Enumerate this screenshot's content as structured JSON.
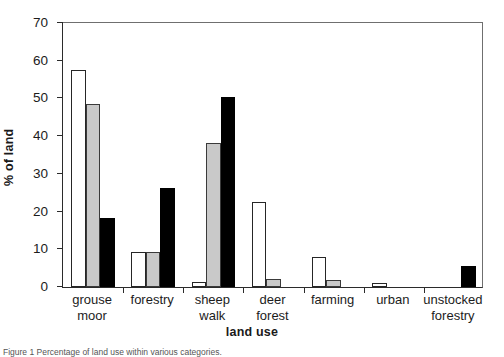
{
  "chart_data": {
    "type": "bar",
    "title": "",
    "xlabel": "land use",
    "ylabel": "% of land",
    "ylim": [
      0,
      70
    ],
    "ytick_values": [
      0,
      10,
      20,
      30,
      40,
      50,
      60,
      70
    ],
    "ytick_labels": [
      "0",
      "10",
      "20",
      "30",
      "40",
      "50",
      "60",
      "70"
    ],
    "grid": false,
    "legend": "none",
    "categories": [
      "grouse moor",
      "forestry",
      "sheep walk",
      "deer forest",
      "farming",
      "urban",
      "unstocked forestry"
    ],
    "category_lines": [
      [
        "grouse",
        "moor"
      ],
      [
        "forestry"
      ],
      [
        "sheep",
        "walk"
      ],
      [
        "deer",
        "forest"
      ],
      [
        "farming"
      ],
      [
        "urban"
      ],
      [
        "unstocked",
        "forestry"
      ]
    ],
    "series": [
      {
        "name": "white",
        "style": "open",
        "color": "#ffffff",
        "edge_color": "#262626",
        "values": [
          57.2,
          9.2,
          1.3,
          22.5,
          8.0,
          1.0,
          0.0
        ]
      },
      {
        "name": "grey",
        "style": "light-grey fill",
        "color": "#c9c9c9",
        "edge_color": "#3a3a3a",
        "values": [
          48.2,
          9.1,
          37.8,
          2.1,
          1.9,
          0.0,
          0.0
        ]
      },
      {
        "name": "black",
        "style": "solid black",
        "color": "#000000",
        "edge_color": "#000000",
        "values": [
          18.2,
          26.0,
          50.0,
          0.0,
          0.0,
          0.0,
          5.5
        ]
      }
    ]
  },
  "axis": {
    "frame_color": "#2b2b2b",
    "tick_color": "#2b2b2b"
  },
  "caption": {
    "text": "Figure 1   Percentage of land use within various categories."
  }
}
